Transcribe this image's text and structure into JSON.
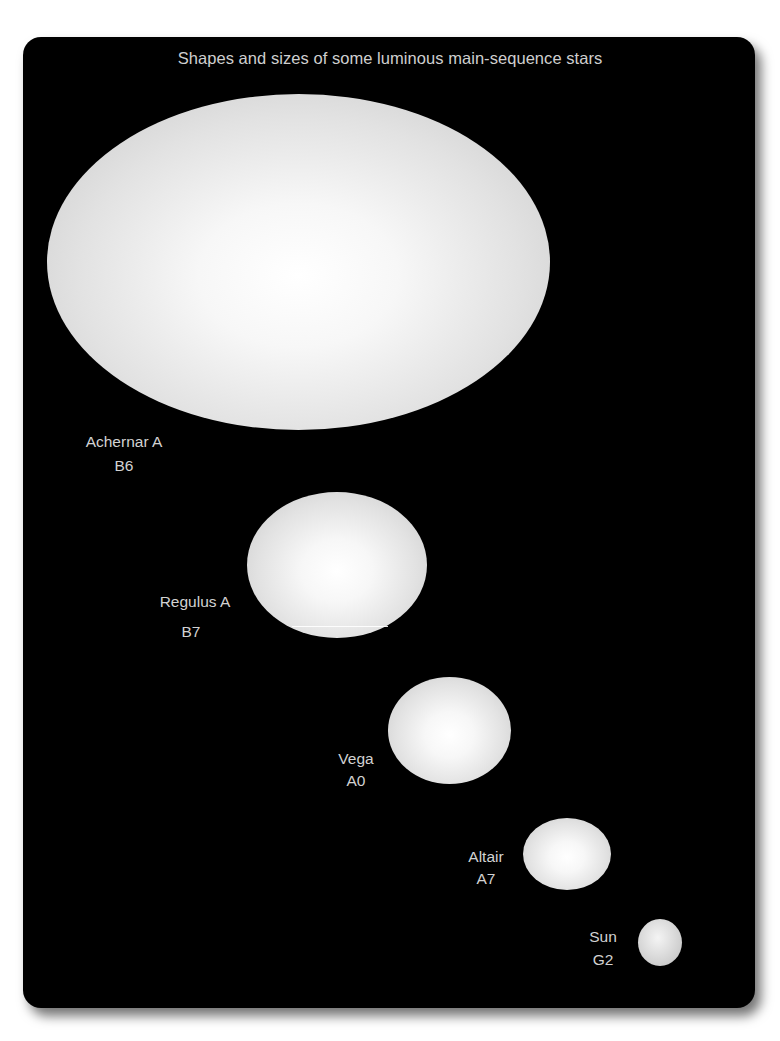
{
  "figure": {
    "title": "Shapes and sizes of some luminous main-sequence stars",
    "background_color": "#000000",
    "text_color": "#d2d2d2"
  },
  "stars": [
    {
      "name": "Achernar A",
      "spectral_type": "B6"
    },
    {
      "name": "Regulus A",
      "spectral_type": "B7"
    },
    {
      "name": "Vega",
      "spectral_type": "A0"
    },
    {
      "name": "Altair",
      "spectral_type": "A7"
    },
    {
      "name": "Sun",
      "spectral_type": "G2"
    }
  ]
}
